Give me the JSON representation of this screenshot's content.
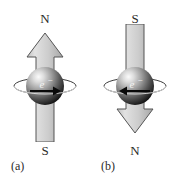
{
  "figure": {
    "colors": {
      "arrow_fill_light": "#d8d8d8",
      "arrow_fill_dark": "#a8a8a8",
      "arrow_stroke": "#4a4a4a",
      "sphere_highlight": "#f2f2f2",
      "sphere_mid": "#9a9a9a",
      "sphere_dark": "#1c1c1c",
      "ring_stroke": "#3a3a3a",
      "label_color": "#2b2b2b",
      "background": "#ffffff"
    },
    "panels": [
      {
        "id": "a",
        "caption": "(a)",
        "top_label": "N",
        "bottom_label": "S",
        "arrow_direction": "up",
        "particle_label": "e",
        "particle_charge": "−"
      },
      {
        "id": "b",
        "caption": "(b)",
        "top_label": "S",
        "bottom_label": "N",
        "arrow_direction": "down",
        "particle_label": "e",
        "particle_charge": "−"
      }
    ]
  }
}
